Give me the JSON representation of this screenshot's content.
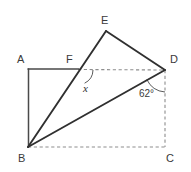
{
  "figure": {
    "kind": "geometry-diagram",
    "background_color": "#ffffff",
    "solid_line_color": "#303030",
    "dashed_line_color": "#8d8d8d",
    "label_color": "#3a3a3a",
    "width": 191,
    "height": 172
  },
  "vertices": {
    "A": {
      "label": "A",
      "x": 28,
      "y": 69,
      "label_x": 17,
      "label_y": 63
    },
    "B": {
      "label": "B",
      "x": 28,
      "y": 147,
      "label_x": 18,
      "label_y": 161
    },
    "C": {
      "label": "C",
      "x": 165,
      "y": 147,
      "label_x": 167,
      "label_y": 161
    },
    "D": {
      "label": "D",
      "x": 165,
      "y": 70,
      "label_x": 170,
      "label_y": 63
    },
    "E": {
      "label": "E",
      "x": 106,
      "y": 31,
      "label_x": 102,
      "label_y": 23
    },
    "F": {
      "label": "F",
      "x": 78,
      "y": 69,
      "label_x": 66,
      "label_y": 63
    }
  },
  "segments": [
    {
      "name": "segment-A-F",
      "from": "A",
      "to": "F",
      "style": "solid"
    },
    {
      "name": "segment-A-B",
      "from": "A",
      "to": "B",
      "style": "solid"
    },
    {
      "name": "segment-B-E",
      "from": "B",
      "to": "E",
      "style": "solid"
    },
    {
      "name": "segment-E-D",
      "from": "E",
      "to": "D",
      "style": "solid"
    },
    {
      "name": "segment-B-D",
      "from": "B",
      "to": "D",
      "style": "solid"
    },
    {
      "name": "segment-F-D",
      "from": "F",
      "to": "D",
      "style": "dashed"
    },
    {
      "name": "segment-B-C",
      "from": "B",
      "to": "C",
      "style": "dashed"
    },
    {
      "name": "segment-D-C",
      "from": "D",
      "to": "C",
      "style": "dashed"
    }
  ],
  "angles": {
    "at_F": {
      "name": "angle-x-at-F",
      "label": "x",
      "label_x": 86,
      "label_y": 92,
      "vertex": "F",
      "arc_radius": 15
    },
    "at_D": {
      "name": "angle-62-at-D",
      "label": "62°",
      "label_x": 152,
      "label_y": 97,
      "vertex": "D",
      "arc_radius": 22
    }
  }
}
